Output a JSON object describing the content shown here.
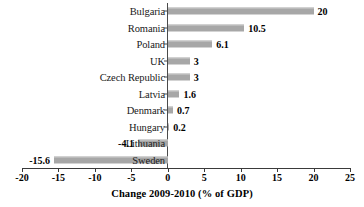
{
  "chart_data": {
    "type": "bar",
    "orientation": "horizontal",
    "title": "",
    "xlabel": "Change 2009-2010 (% of GDP)",
    "ylabel": "",
    "xlim": [
      -20,
      25
    ],
    "xticks": [
      -20,
      -15,
      -10,
      -5,
      0,
      5,
      10,
      15,
      20,
      25
    ],
    "xtick_labels": [
      "-20",
      "-15",
      "-10",
      "-5",
      "0",
      "5",
      "10",
      "15",
      "20",
      "25"
    ],
    "grid": false,
    "legend": null,
    "bar_color": "#a7a7a7",
    "categories": [
      "Bulgaria",
      "Romania",
      "Poland",
      "UK",
      "Czech Republic",
      "Latvia",
      "Denmark",
      "Hungary",
      "Lithuania",
      "Sweden"
    ],
    "values": [
      20,
      10.5,
      6.1,
      3,
      3,
      1.6,
      0.7,
      0.2,
      -4.1,
      -15.6
    ],
    "value_labels": [
      "20",
      "10.5",
      "6.1",
      "3",
      "3",
      "1.6",
      "0.7",
      "0.2",
      "-4.1",
      "-15.6"
    ],
    "points": [
      {
        "category": "Bulgaria",
        "value": 20,
        "label": "20"
      },
      {
        "category": "Romania",
        "value": 10.5,
        "label": "10.5"
      },
      {
        "category": "Poland",
        "value": 6.1,
        "label": "6.1"
      },
      {
        "category": "UK",
        "value": 3,
        "label": "3"
      },
      {
        "category": "Czech Republic",
        "value": 3,
        "label": "3"
      },
      {
        "category": "Latvia",
        "value": 1.6,
        "label": "1.6"
      },
      {
        "category": "Denmark",
        "value": 0.7,
        "label": "0.7"
      },
      {
        "category": "Hungary",
        "value": 0.2,
        "label": "0.2"
      },
      {
        "category": "Lithuania",
        "value": -4.1,
        "label": "-4.1"
      },
      {
        "category": "Sweden",
        "value": -15.6,
        "label": "-15.6"
      }
    ]
  }
}
